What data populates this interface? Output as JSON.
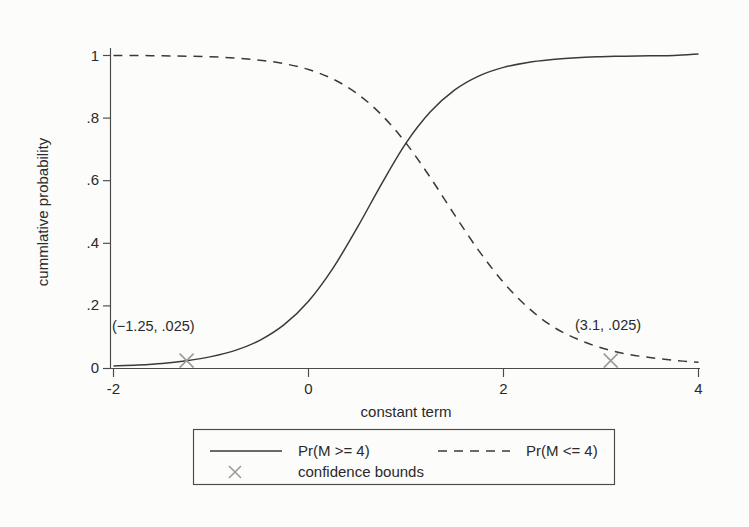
{
  "chart_data": {
    "type": "line",
    "title": "",
    "xlabel": "constant term",
    "ylabel": "cummlative probability",
    "xlim": [
      -2,
      4
    ],
    "ylim": [
      0,
      1.02
    ],
    "xticks": [
      "-2",
      "0",
      "2",
      "4"
    ],
    "xtick_values": [
      -2,
      0,
      2,
      4
    ],
    "yticks": [
      "0",
      ".2",
      ".4",
      ".6",
      ".8",
      "1"
    ],
    "ytick_values": [
      0,
      0.2,
      0.4,
      0.6,
      0.8,
      1
    ],
    "grid": false,
    "legend_position": "below-axes",
    "series": [
      {
        "name": "Pr(M >= 4)",
        "style": "solid",
        "x": [
          -2,
          -1.75,
          -1.5,
          -1.25,
          -1,
          -0.75,
          -0.5,
          -0.25,
          0,
          0.25,
          0.5,
          0.75,
          1,
          1.25,
          1.5,
          1.75,
          2,
          2.25,
          2.5,
          2.75,
          3,
          3.25,
          3.5,
          3.75,
          4
        ],
        "values": [
          0.008,
          0.011,
          0.016,
          0.025,
          0.038,
          0.058,
          0.09,
          0.14,
          0.215,
          0.32,
          0.45,
          0.59,
          0.72,
          0.82,
          0.89,
          0.935,
          0.962,
          0.978,
          0.987,
          0.993,
          0.996,
          0.998,
          0.999,
          1.0,
          1.005
        ]
      },
      {
        "name": "Pr(M <= 4)",
        "style": "dashed",
        "x": [
          -2,
          -1.75,
          -1.5,
          -1.25,
          -1,
          -0.75,
          -0.5,
          -0.25,
          0,
          0.25,
          0.5,
          0.75,
          1,
          1.25,
          1.5,
          1.75,
          2,
          2.25,
          2.5,
          2.75,
          3,
          3.25,
          3.5,
          3.75,
          4
        ],
        "values": [
          1.0,
          1.0,
          0.999,
          0.998,
          0.996,
          0.992,
          0.985,
          0.974,
          0.955,
          0.925,
          0.878,
          0.81,
          0.72,
          0.61,
          0.49,
          0.375,
          0.275,
          0.195,
          0.135,
          0.095,
          0.066,
          0.047,
          0.035,
          0.026,
          0.02
        ]
      }
    ],
    "markers": [
      {
        "name": "lower-confidence-bound",
        "label": "(−1.25, .025)",
        "x": -1.25,
        "y": 0.025,
        "style": "x",
        "color": "#9a9a9a"
      },
      {
        "name": "upper-confidence-bound",
        "label": "(3.1, .025)",
        "x": 3.1,
        "y": 0.025,
        "style": "x",
        "color": "#9a9a9a"
      }
    ],
    "legend": [
      {
        "label": "Pr(M >= 4)",
        "style": "solid"
      },
      {
        "label": "Pr(M <= 4)",
        "style": "dashed"
      },
      {
        "label": "confidence bounds",
        "style": "marker-x"
      }
    ],
    "colors": {
      "line": "#3a3a3a",
      "marker": "#9a9a9a",
      "axis": "#4a4a4a",
      "text": "#2a2a2a",
      "background": "#fcfcfb"
    }
  }
}
